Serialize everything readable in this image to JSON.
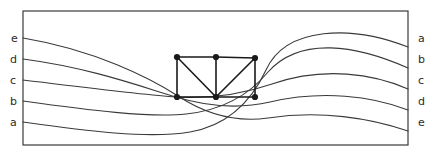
{
  "figure": {
    "title": "",
    "frame": {
      "x": 23,
      "y": 11,
      "width": 385,
      "height": 134,
      "stroke_color": "#3a3a3a",
      "stroke_width": 1.2
    },
    "stroke_color": "#3a3a3a",
    "curve_stroke_width": 1.1,
    "edge_stroke_width": 1.6,
    "node_color": "#1a1a1a",
    "node_radius": 3.1
  },
  "left_labels": [
    {
      "text": "e",
      "x": 11,
      "y": 42
    },
    {
      "text": "d",
      "x": 10,
      "y": 63
    },
    {
      "text": "c",
      "x": 10,
      "y": 84
    },
    {
      "text": "b",
      "x": 10,
      "y": 105
    },
    {
      "text": "a",
      "x": 10,
      "y": 126
    }
  ],
  "right_labels": [
    {
      "text": "a",
      "x": 418,
      "y": 42
    },
    {
      "text": "b",
      "x": 418,
      "y": 63
    },
    {
      "text": "c",
      "x": 418,
      "y": 84
    },
    {
      "text": "d",
      "x": 418,
      "y": 105
    },
    {
      "text": "e",
      "x": 418,
      "y": 126
    }
  ],
  "curves": [
    {
      "name": "curve-e-to-e",
      "from_label": "e",
      "to_label": "e",
      "start": [
        23,
        38
      ],
      "end": [
        408,
        131
      ],
      "path": "M 23 38 C 95 50 150 78 178 96 C 210 117 240 122 268 118 C 320 110 370 118 408 131"
    },
    {
      "name": "curve-d-to-d",
      "from_label": "d",
      "to_label": "d",
      "start": [
        23,
        59
      ],
      "end": [
        408,
        110
      ],
      "path": "M 23 59 C 92 68 145 88 176 97 C 212 108 244 108 270 102 C 322 90 372 96 408 110"
    },
    {
      "name": "curve-c-to-c",
      "from_label": "c",
      "to_label": "c",
      "start": [
        23,
        80
      ],
      "end": [
        408,
        89
      ],
      "path": "M 23 80 C 90 88 146 95 176 97 C 214 99 246 93 272 84 C 324 66 374 74 408 89"
    },
    {
      "name": "curve-b-to-b",
      "from_label": "b",
      "to_label": "b",
      "start": [
        23,
        101
      ],
      "end": [
        408,
        68
      ],
      "path": "M 23 101 C 88 110 150 118 186 114 C 224 110 250 94 268 72 C 300 36 356 45 408 68"
    },
    {
      "name": "curve-a-to-a",
      "from_label": "a",
      "to_label": "a",
      "start": [
        23,
        122
      ],
      "end": [
        408,
        47
      ],
      "path": "M 23 122 C 86 131 148 139 190 132 C 230 125 252 100 266 70 C 286 26 352 25 408 47"
    }
  ],
  "graph": {
    "nodes": [
      {
        "id": "n-top-left",
        "x": 177,
        "y": 57
      },
      {
        "id": "n-top-mid",
        "x": 216,
        "y": 57
      },
      {
        "id": "n-top-right",
        "x": 255,
        "y": 58
      },
      {
        "id": "n-bot-left",
        "x": 177,
        "y": 97
      },
      {
        "id": "n-bot-mid",
        "x": 216,
        "y": 97
      },
      {
        "id": "n-bot-right",
        "x": 255,
        "y": 97
      }
    ],
    "edges": [
      {
        "name": "edge-top-left-top-mid",
        "from": "n-top-left",
        "to": "n-top-mid"
      },
      {
        "name": "edge-top-mid-top-right",
        "from": "n-top-mid",
        "to": "n-top-right"
      },
      {
        "name": "edge-bot-left-bot-mid",
        "from": "n-bot-left",
        "to": "n-bot-mid"
      },
      {
        "name": "edge-bot-mid-bot-right",
        "from": "n-bot-mid",
        "to": "n-bot-right"
      },
      {
        "name": "edge-top-left-bot-left",
        "from": "n-top-left",
        "to": "n-bot-left"
      },
      {
        "name": "edge-top-mid-bot-mid",
        "from": "n-top-mid",
        "to": "n-bot-mid"
      },
      {
        "name": "edge-top-right-bot-right",
        "from": "n-top-right",
        "to": "n-bot-right"
      },
      {
        "name": "edge-diagonal-left",
        "from": "n-top-left",
        "to": "n-bot-mid"
      },
      {
        "name": "edge-diagonal-right",
        "from": "n-top-right",
        "to": "n-bot-mid"
      }
    ]
  }
}
